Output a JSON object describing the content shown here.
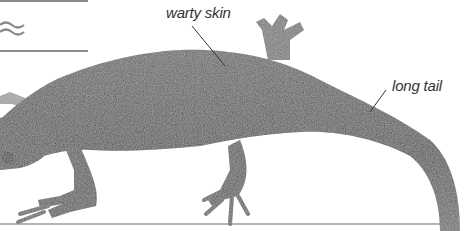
{
  "labels": {
    "skin": "warty skin",
    "tail": "long tail"
  },
  "icons": {
    "water": "wave-icon"
  },
  "colors": {
    "body": "#4a4a4a",
    "rule": "#8a8a8a",
    "text": "#333333"
  }
}
